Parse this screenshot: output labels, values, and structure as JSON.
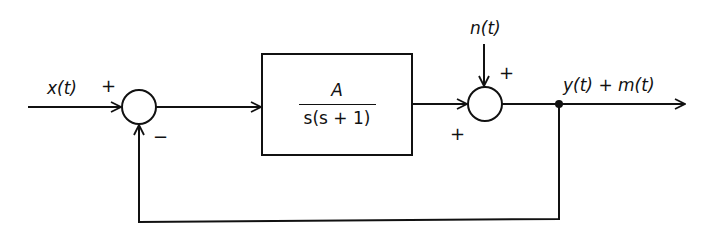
{
  "diagram": {
    "type": "feedback-control-block-diagram",
    "line_color": "#111111",
    "input": {
      "label": "x(t)",
      "sign": "+"
    },
    "summing_junction_1": {
      "input_sign": "+",
      "feedback_sign": "−"
    },
    "plant": {
      "numerator": "A",
      "denominator": "s(s + 1)"
    },
    "summing_junction_2": {
      "disturbance_label": "n(t)",
      "disturbance_sign": "+",
      "plant_sign": "+"
    },
    "output": {
      "label": "y(t) + m(t)"
    },
    "feedback": {
      "type": "unity"
    }
  }
}
